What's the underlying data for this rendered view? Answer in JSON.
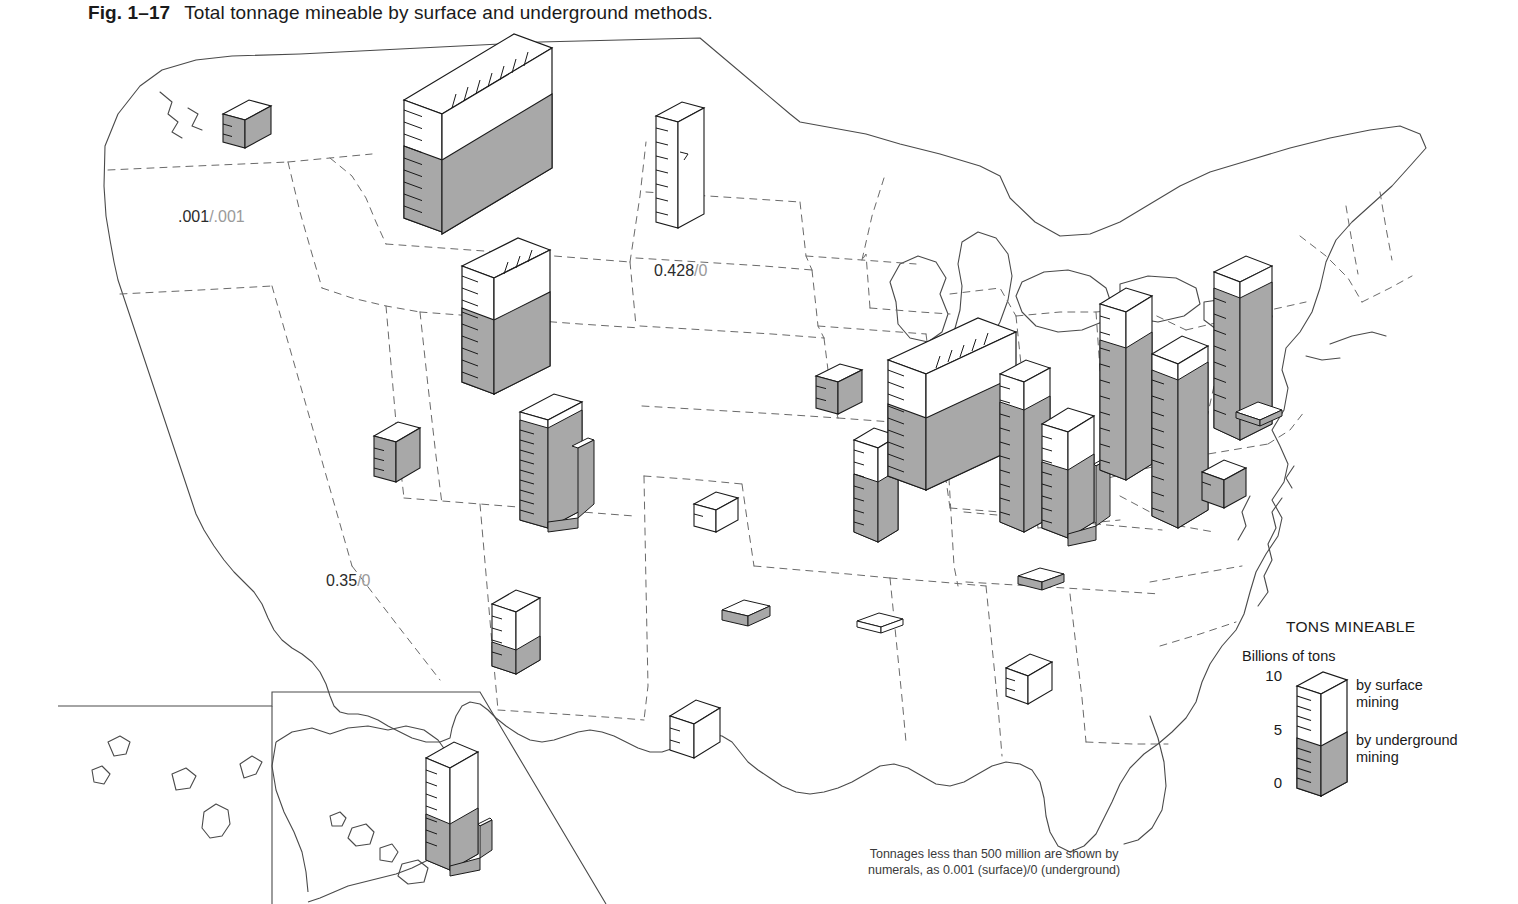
{
  "caption": {
    "fig_number": "Fig. 1–17",
    "title": "Total tonnage mineable by surface and underground methods."
  },
  "legend": {
    "title": "TONS MINEABLE",
    "units": "Billions of tons",
    "ticks": [
      "10",
      "5",
      "0"
    ],
    "surface_label_line1": "by surface",
    "surface_label_line2": "mining",
    "underground_label_line1": "by underground",
    "underground_label_line2": "mining"
  },
  "footnote": "Tonnages less than 500 million are shown by\nnumerals, as 0.001 (surface)/0 (underground)",
  "colors": {
    "underground_fill": "#a8a8a8",
    "surface_fill": "#ffffff",
    "outline": "#1a1a1a",
    "state_border": "#4a4a4a",
    "annotation_numerator": "#2b2b2b",
    "annotation_denominator": "#9a9a9a"
  },
  "annotations": [
    {
      "id": "idaho",
      "surface": ".001",
      "separator": "/",
      "underground": ".001",
      "x": 178,
      "y": 182
    },
    {
      "id": "south-dakota",
      "surface": "0.428",
      "separator": "/",
      "underground": "0",
      "x": 654,
      "y": 236
    },
    {
      "id": "arizona",
      "surface": "0.35",
      "separator": "/",
      "underground": "0",
      "x": 326,
      "y": 546
    }
  ],
  "chart_data": {
    "type": "map-bar",
    "title": "Total tonnage mineable by surface and underground methods.",
    "value_unit": "billions of tons",
    "legend_scale_max": 10,
    "legend_scale_mid": 5,
    "legend_scale_min": 0,
    "series": [
      {
        "name": "by surface mining",
        "color": "#ffffff"
      },
      {
        "name": "by underground mining",
        "color": "#a8a8a8"
      }
    ],
    "states": [
      {
        "state": "Washington",
        "surface": 0.3,
        "underground": 0.9,
        "shown_as": "bar"
      },
      {
        "state": "Idaho",
        "surface": 0.001,
        "underground": 0.001,
        "shown_as": "numeral"
      },
      {
        "state": "Montana",
        "surface": 16.0,
        "underground": 26.0,
        "shown_as": "bar"
      },
      {
        "state": "North Dakota",
        "surface": 8.5,
        "underground": 0.0,
        "shown_as": "bar"
      },
      {
        "state": "South Dakota",
        "surface": 0.428,
        "underground": 0.0,
        "shown_as": "numeral"
      },
      {
        "state": "Wyoming",
        "surface": 9.0,
        "underground": 14.0,
        "shown_as": "bar"
      },
      {
        "state": "Nevada",
        "surface": 0.0,
        "underground": 1.2,
        "shown_as": "bar"
      },
      {
        "state": "Utah",
        "surface": 0.6,
        "underground": 9.5,
        "shown_as": "bar"
      },
      {
        "state": "Colorado",
        "surface": 0.5,
        "underground": 6.5,
        "shown_as": "bar"
      },
      {
        "state": "Arizona",
        "surface": 0.35,
        "underground": 0.0,
        "shown_as": "numeral"
      },
      {
        "state": "New Mexico",
        "surface": 2.6,
        "underground": 1.6,
        "shown_as": "bar"
      },
      {
        "state": "Texas",
        "surface": 1.8,
        "underground": 0.0,
        "shown_as": "bar"
      },
      {
        "state": "Oklahoma",
        "surface": 0.3,
        "underground": 0.5,
        "shown_as": "bar"
      },
      {
        "state": "Kansas",
        "surface": 0.9,
        "underground": 0.0,
        "shown_as": "bar"
      },
      {
        "state": "Arkansas",
        "surface": 0.3,
        "underground": 0.1,
        "shown_as": "bar"
      },
      {
        "state": "Iowa",
        "surface": 0.2,
        "underground": 1.3,
        "shown_as": "bar"
      },
      {
        "state": "Missouri",
        "surface": 1.8,
        "underground": 2.6,
        "shown_as": "bar"
      },
      {
        "state": "Illinois",
        "surface": 6.5,
        "underground": 27.0,
        "shown_as": "bar"
      },
      {
        "state": "Indiana",
        "surface": 2.6,
        "underground": 6.5,
        "shown_as": "bar"
      },
      {
        "state": "Kentucky",
        "surface": 3.0,
        "underground": 9.0,
        "shown_as": "bar"
      },
      {
        "state": "Tennessee",
        "surface": 0.1,
        "underground": 0.6,
        "shown_as": "bar"
      },
      {
        "state": "Alabama",
        "surface": 1.3,
        "underground": 0.0,
        "shown_as": "bar"
      },
      {
        "state": "Ohio",
        "surface": 4.0,
        "underground": 12.0,
        "shown_as": "bar"
      },
      {
        "state": "West Virginia",
        "surface": 1.5,
        "underground": 17.0,
        "shown_as": "bar"
      },
      {
        "state": "Pennsylvania",
        "surface": 1.5,
        "underground": 20.0,
        "shown_as": "bar"
      },
      {
        "state": "Maryland",
        "surface": 0.2,
        "underground": 0.3,
        "shown_as": "bar"
      },
      {
        "state": "Virginia",
        "surface": 0.4,
        "underground": 1.0,
        "shown_as": "bar"
      },
      {
        "state": "Alaska",
        "surface": 6.0,
        "underground": 5.0,
        "shown_as": "bar"
      }
    ]
  }
}
